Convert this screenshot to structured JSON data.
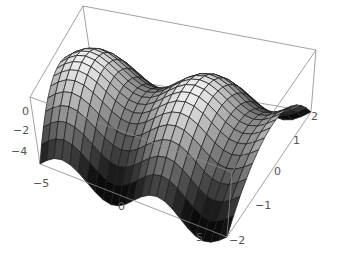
{
  "chart_data": {
    "type": "surface3d",
    "title": "",
    "function": "Sin[x] - y^2",
    "x": {
      "label": "",
      "range": [
        -6.2832,
        6.2832
      ],
      "ticks": [
        -5,
        0,
        5
      ]
    },
    "y": {
      "label": "",
      "range": [
        -2,
        2
      ],
      "ticks": [
        -2,
        -1,
        0,
        1,
        2
      ]
    },
    "z": {
      "label": "",
      "range": [
        -4,
        1
      ],
      "ticks": [
        0,
        -2,
        -4
      ]
    },
    "mesh": {
      "nx": 24,
      "ny": 15
    },
    "shading": "grayscale by height",
    "box": true,
    "grid": false,
    "legend": "none"
  },
  "axes_labels": {
    "z": [
      "0",
      "-2",
      "-4"
    ],
    "x": [
      "-5",
      "0",
      "5"
    ],
    "y": [
      "-2",
      "-1",
      "0",
      "1",
      "2"
    ]
  },
  "colors": {
    "background": "#ffffff",
    "box_line": "#8a8a8a",
    "mesh_line": "#1a1a1a",
    "surface_high": "#f2f2f2",
    "surface_low": "#0c0c0c"
  }
}
